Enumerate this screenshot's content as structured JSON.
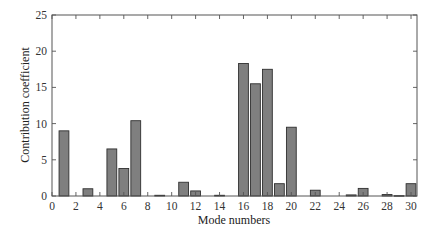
{
  "chart_data": {
    "type": "bar",
    "title": "",
    "xlabel": "Mode numbers",
    "ylabel": "Contribution coefficient",
    "xlim": [
      0,
      30.5
    ],
    "ylim": [
      0,
      25
    ],
    "xticks": [
      0,
      2,
      4,
      6,
      8,
      10,
      12,
      14,
      16,
      18,
      20,
      22,
      24,
      26,
      28,
      30
    ],
    "yticks": [
      0,
      5,
      10,
      15,
      20,
      25
    ],
    "grid": false,
    "legend": null,
    "bar_color": "#7f7f7f",
    "bar_edge_color": "#2f2f2f",
    "categories": [
      1,
      2,
      3,
      4,
      5,
      6,
      7,
      8,
      9,
      10,
      11,
      12,
      13,
      14,
      15,
      16,
      17,
      18,
      19,
      20,
      21,
      22,
      23,
      24,
      25,
      26,
      27,
      28,
      29,
      30
    ],
    "values": [
      9.0,
      0.0,
      1.0,
      0.0,
      6.5,
      3.8,
      10.4,
      0.0,
      0.1,
      0.0,
      1.9,
      0.7,
      0.0,
      0.1,
      0.0,
      18.3,
      15.5,
      17.5,
      1.7,
      9.5,
      0.0,
      0.8,
      0.0,
      0.0,
      0.15,
      1.05,
      0.0,
      0.2,
      0.05,
      1.7
    ]
  }
}
